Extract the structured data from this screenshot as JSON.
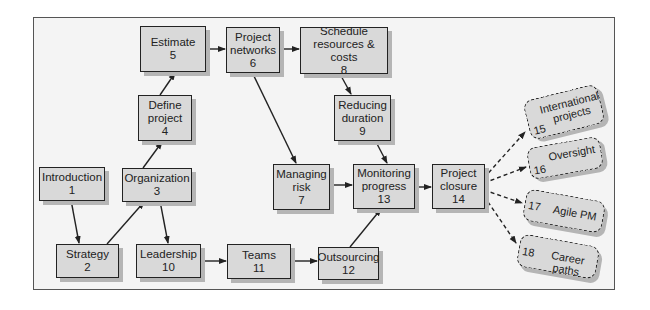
{
  "diagram": {
    "type": "flowchart",
    "nodes": [
      {
        "id": 1,
        "label": "Introduction",
        "number": "1"
      },
      {
        "id": 2,
        "label": "Strategy",
        "number": "2"
      },
      {
        "id": 3,
        "label": "Organization",
        "number": "3"
      },
      {
        "id": 4,
        "label_lines": [
          "Define",
          "project"
        ],
        "number": "4"
      },
      {
        "id": 5,
        "label": "Estimate",
        "number": "5"
      },
      {
        "id": 6,
        "label_lines": [
          "Project",
          "networks"
        ],
        "number": "6"
      },
      {
        "id": 7,
        "label_lines": [
          "Managing",
          "risk"
        ],
        "number": "7"
      },
      {
        "id": 8,
        "label_lines": [
          "Schedule",
          "resources & costs"
        ],
        "number": "8"
      },
      {
        "id": 9,
        "label_lines": [
          "Reducing",
          "duration"
        ],
        "number": "9"
      },
      {
        "id": 10,
        "label": "Leadership",
        "number": "10"
      },
      {
        "id": 11,
        "label": "Teams",
        "number": "11"
      },
      {
        "id": 12,
        "label": "Outsourcing",
        "number": "12"
      },
      {
        "id": 13,
        "label_lines": [
          "Monitoring",
          "progress"
        ],
        "number": "13"
      },
      {
        "id": 14,
        "label_lines": [
          "Project",
          "closure"
        ],
        "number": "14"
      },
      {
        "id": 15,
        "label_lines": [
          "International",
          "projects"
        ],
        "number": "15",
        "style": "dashed"
      },
      {
        "id": 16,
        "label": "Oversight",
        "number": "16",
        "style": "dashed"
      },
      {
        "id": 17,
        "label": "Agile PM",
        "number": "17",
        "style": "dashed"
      },
      {
        "id": 18,
        "label": "Career paths",
        "number": "18",
        "style": "dashed"
      }
    ],
    "edges": [
      {
        "from": 1,
        "to": 2
      },
      {
        "from": 2,
        "to": 3
      },
      {
        "from": 3,
        "to": 4
      },
      {
        "from": 3,
        "to": 10
      },
      {
        "from": 4,
        "to": 5
      },
      {
        "from": 5,
        "to": 6
      },
      {
        "from": 6,
        "to": 8
      },
      {
        "from": 6,
        "to": 7
      },
      {
        "from": 8,
        "to": 9
      },
      {
        "from": 9,
        "to": 13
      },
      {
        "from": 7,
        "to": 13
      },
      {
        "from": 10,
        "to": 11
      },
      {
        "from": 11,
        "to": 12
      },
      {
        "from": 12,
        "to": 13
      },
      {
        "from": 13,
        "to": 14
      },
      {
        "from": 14,
        "to": 15,
        "style": "dashed"
      },
      {
        "from": 14,
        "to": 16,
        "style": "dashed"
      },
      {
        "from": 14,
        "to": 17,
        "style": "dashed"
      },
      {
        "from": 14,
        "to": 18,
        "style": "dashed"
      }
    ]
  },
  "colors": {
    "box_fill": "#d9d9d9",
    "border": "#222222",
    "shadow": "#b5b5b5",
    "background": "#f4f4f4"
  }
}
